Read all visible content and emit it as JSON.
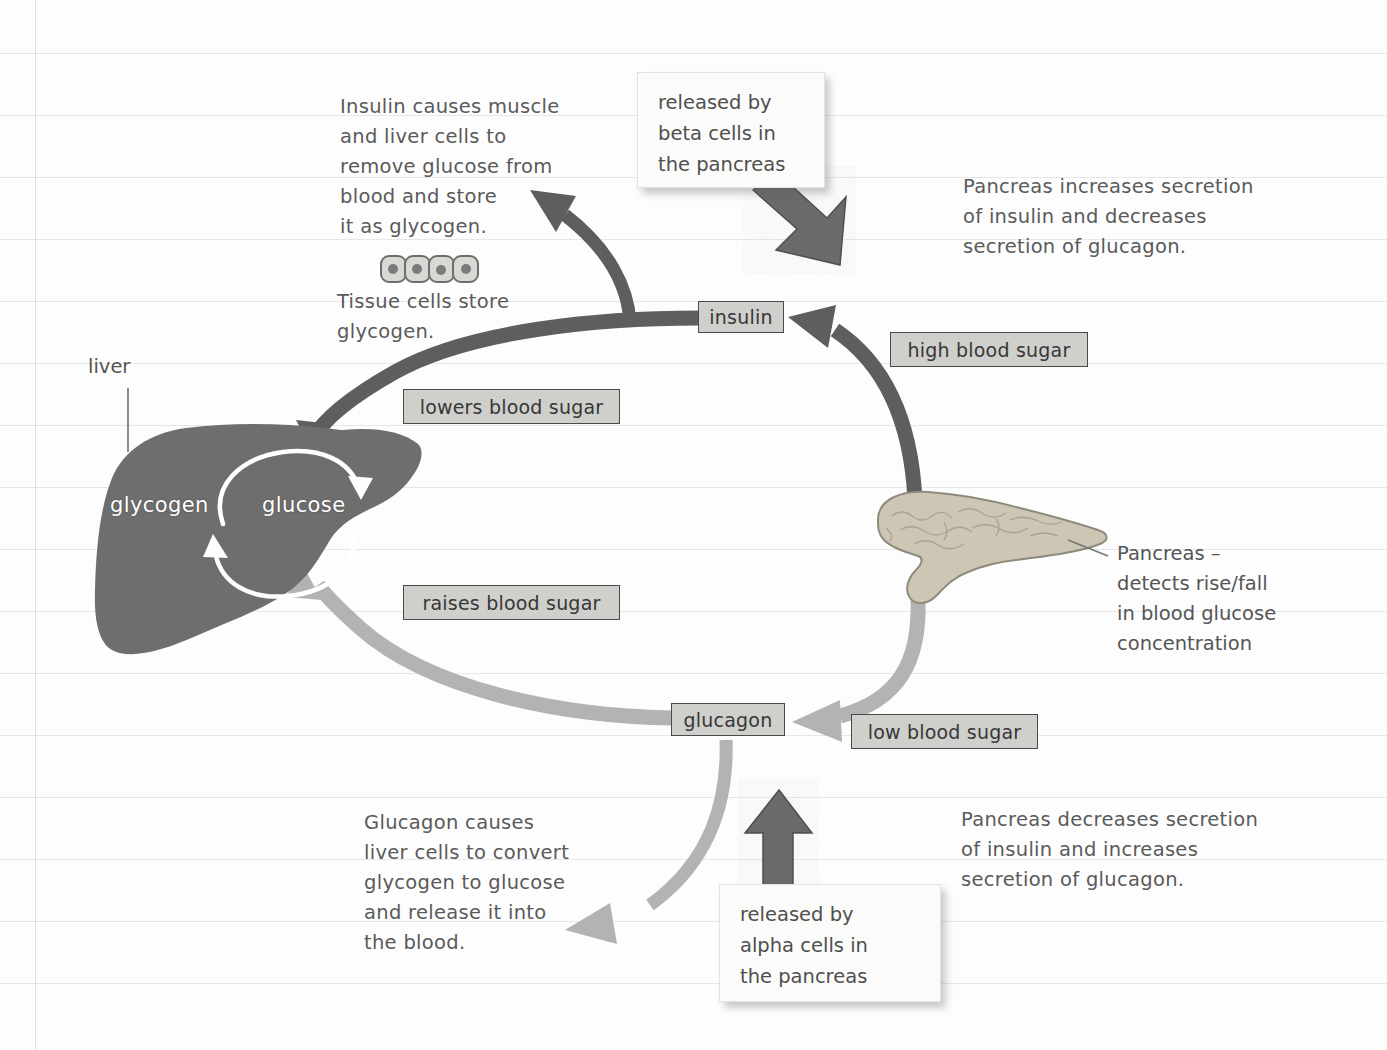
{
  "diagram": {
    "colors": {
      "dark_arrow": "#5e5e5e",
      "light_arrow": "#b3b3b3",
      "liver_fill": "#6e6e6e",
      "pancreas_fill": "#cdc6b4",
      "chip_fill": "#cfcfcb",
      "chip_border": "#4a4a4a",
      "paper": "#fdfdfd",
      "rule_line": "#8296af"
    },
    "notes": {
      "insulin_effect": "Insulin causes muscle\nand liver cells to\nremove glucose from\nblood and store\nit as glycogen.",
      "tissue_cells": "Tissue cells store\nglycogen.",
      "pancreas_high": "Pancreas increases secretion\nof insulin and decreases\nsecretion of glucagon.",
      "pancreas_low": "Pancreas decreases secretion\nof insulin and increases\nsecretion of glucagon.",
      "glucagon_effect": "Glucagon causes\nliver cells to convert\nglycogen to glucose\nand release it into\nthe blood.",
      "pancreas_label": "Pancreas –\ndetects rise/fall\nin blood glucose\nconcentration",
      "liver_label": "liver"
    },
    "cards": {
      "beta_cells": "released by\nbeta cells in\nthe pancreas",
      "alpha_cells": "released by\nalpha cells in\nthe pancreas"
    },
    "chips": {
      "insulin": "insulin",
      "glucagon": "glucagon",
      "high_blood_sugar": "high blood sugar",
      "low_blood_sugar": "low blood sugar",
      "lowers_blood_sugar": "lowers blood sugar",
      "raises_blood_sugar": "raises blood sugar"
    },
    "liver_terms": {
      "glycogen": "glycogen",
      "glucose": "glucose"
    }
  }
}
